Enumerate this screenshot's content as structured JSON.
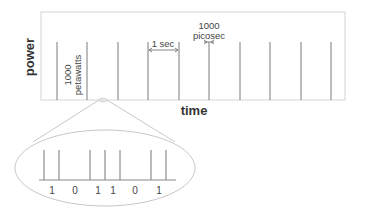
{
  "diagram": {
    "axis": {
      "y_label": "power",
      "x_label": "time"
    },
    "annotations": {
      "peak_power_line1": "1000",
      "peak_power_line2": "petawatts",
      "period_label": "1 sec",
      "pulse_width_line1": "1000",
      "pulse_width_line2": "picosec"
    },
    "pulse_train": {
      "count": 10,
      "spacing_label": "1 sec"
    },
    "zoom_lens": {
      "bits": [
        "1",
        "0",
        "1",
        "1",
        "0",
        "1"
      ]
    },
    "colors": {
      "frame": "#d0d0d0",
      "pulse": "#777777",
      "lens": "#c8c8c8",
      "text": "#444444"
    }
  }
}
